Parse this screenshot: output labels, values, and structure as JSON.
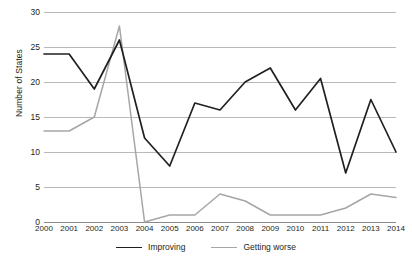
{
  "chart_data": {
    "type": "line",
    "title": "",
    "xlabel": "",
    "ylabel": "Number of States",
    "categories": [
      "2000",
      "2001",
      "2002",
      "2003",
      "2004",
      "2005",
      "2006",
      "2007",
      "2008",
      "2009",
      "2010",
      "2011",
      "2012",
      "2013",
      "2014"
    ],
    "ylim": [
      0,
      30
    ],
    "yticks": [
      0,
      5,
      10,
      15,
      20,
      25,
      30
    ],
    "grid": true,
    "legend_position": "bottom",
    "series": [
      {
        "name": "Improving",
        "color": "#231f20",
        "values": [
          24,
          24,
          19,
          26,
          12,
          8,
          17,
          16,
          20,
          22,
          16,
          20.5,
          7,
          17.5,
          10
        ]
      },
      {
        "name": "Getting worse",
        "color": "#a6a6a6",
        "values": [
          13,
          13,
          15,
          28,
          0,
          1,
          1,
          4,
          3,
          1,
          1,
          1,
          2,
          4,
          3.5
        ]
      }
    ]
  },
  "axis": {
    "ylabel": "Number of States"
  }
}
